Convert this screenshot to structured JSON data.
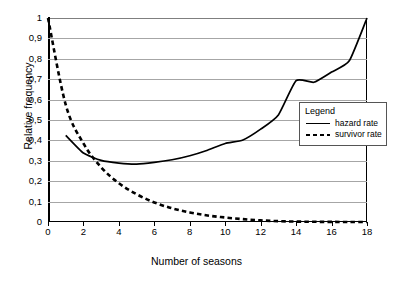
{
  "chart_data": {
    "type": "line",
    "title": "",
    "xlabel": "Number of seasons",
    "ylabel": "Relative frequency",
    "xlim": [
      0,
      18
    ],
    "ylim": [
      0,
      1
    ],
    "grid": true,
    "legend_position": "inside-right",
    "legend_title": "Legend",
    "x_ticks": [
      "0",
      "2",
      "4",
      "6",
      "8",
      "10",
      "12",
      "14",
      "16",
      "18"
    ],
    "x_tick_values": [
      0,
      2,
      4,
      6,
      8,
      10,
      12,
      14,
      16,
      18
    ],
    "y_ticks": [
      "0",
      "0,1",
      "0,2",
      "0,3",
      "0,4",
      "0,5",
      "0,6",
      "0,7",
      "0,8",
      "0,9",
      "1"
    ],
    "y_tick_values": [
      0,
      0.1,
      0.2,
      0.3,
      0.4,
      0.5,
      0.6,
      0.7,
      0.8,
      0.9,
      1.0
    ],
    "series": [
      {
        "name": "hazard rate",
        "style": "solid",
        "color": "#000000",
        "x": [
          1,
          2,
          3,
          4,
          5,
          6,
          7,
          8,
          9,
          10,
          11,
          12,
          13,
          14,
          15,
          16,
          17,
          18
        ],
        "values": [
          0.425,
          0.338,
          0.302,
          0.289,
          0.284,
          0.292,
          0.305,
          0.325,
          0.352,
          0.385,
          0.402,
          0.455,
          0.525,
          0.693,
          0.685,
          0.735,
          0.79,
          1.0
        ]
      },
      {
        "name": "survivor rate",
        "style": "dashed",
        "color": "#000000",
        "x": [
          0,
          1,
          2,
          3,
          4,
          5,
          6,
          7,
          8,
          9,
          10,
          11,
          12,
          13,
          14,
          15,
          16,
          17,
          18
        ],
        "values": [
          1.0,
          0.575,
          0.385,
          0.268,
          0.19,
          0.136,
          0.096,
          0.067,
          0.047,
          0.032,
          0.022,
          0.014,
          0.008,
          0.004,
          0.002,
          0.001,
          0.0005,
          0.0002,
          0.0
        ]
      }
    ]
  }
}
